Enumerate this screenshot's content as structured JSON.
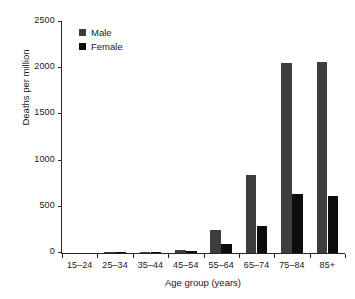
{
  "chart_data": {
    "type": "bar",
    "title": "",
    "subtitle": "",
    "xlabel": "Age group (years)",
    "ylabel": "Deaths per million",
    "categories": [
      "15–24",
      "25–34",
      "35–44",
      "45–54",
      "55–64",
      "65–74",
      "75–84",
      "85+"
    ],
    "series": [
      {
        "name": "Male",
        "color": "#3d3d3d",
        "values": [
          0,
          1,
          7,
          38,
          250,
          845,
          2055,
          2070
        ]
      },
      {
        "name": "Female",
        "color": "#0c0c0c",
        "values": [
          0,
          1,
          4,
          18,
          95,
          290,
          640,
          620
        ]
      }
    ],
    "ylim": [
      0,
      2500
    ],
    "yticks": [
      0,
      500,
      1000,
      1500,
      2000,
      2500
    ],
    "ytick_labels": [
      "0",
      "500",
      "1000",
      "1500",
      "2000",
      "2500"
    ],
    "grid": false,
    "legend_position": "top-left",
    "legend_entries": [
      "Male",
      "Female"
    ]
  },
  "legend": {
    "items": [
      {
        "label": "Male",
        "swatch": "male-swatch-icon"
      },
      {
        "label": "Female",
        "swatch": "female-swatch-icon"
      }
    ]
  },
  "axes": {
    "x_title": "Age group (years)",
    "y_title": "Deaths per million"
  }
}
